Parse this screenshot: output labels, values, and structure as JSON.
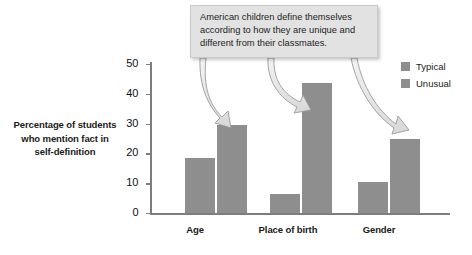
{
  "chart_data": {
    "type": "bar",
    "title": "",
    "xlabel": "",
    "ylabel": "Percentage of students who mention fact in self-definition",
    "categories": [
      "Age",
      "Place of birth",
      "Gender"
    ],
    "series": [
      {
        "name": "Typical",
        "values": [
          18.5,
          6.5,
          10.5
        ],
        "color": "#8e8e8e"
      },
      {
        "name": "Unusual",
        "values": [
          29.5,
          43.5,
          25.0
        ],
        "color": "#8e8e8e"
      }
    ],
    "ylim": [
      0,
      50
    ],
    "yticks": [
      0,
      10,
      20,
      30,
      40,
      50
    ],
    "ytick_labels": [
      "0",
      "10",
      "20",
      "30",
      "40",
      "50"
    ],
    "grid": false,
    "legend_position": "right"
  },
  "axis_label": {
    "lines": [
      "Percentage of students",
      "who mention fact in",
      "self-definition"
    ]
  },
  "callout": {
    "lines": [
      "American children define themselves",
      "according to how they are unique and",
      "different from their classmates."
    ],
    "background": "#e2e2e2",
    "arrow_targets": [
      "Age / Unusual",
      "Place of birth / Unusual",
      "Gender / Unusual"
    ]
  },
  "legend": {
    "items": [
      {
        "label": "Typical",
        "color": "#8e8e8e"
      },
      {
        "label": "Unusual",
        "color": "#8e8e8e"
      }
    ]
  },
  "colors": {
    "bar": "#8e8e8e",
    "axis": "#7d7d7d",
    "callout_bg": "#e2e2e2",
    "text": "#1a1a1a",
    "page_bg": "#ffffff"
  }
}
